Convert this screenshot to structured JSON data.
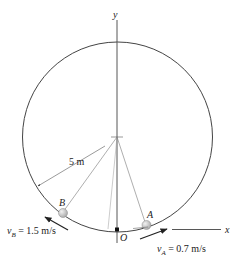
{
  "diagram": {
    "axes": {
      "y_label": "y",
      "x_label": "x"
    },
    "origin_label": "O",
    "radius_label": "5 m",
    "points": [
      {
        "name": "A",
        "velocity_label": "v",
        "velocity_sub": "A",
        "velocity_value": "= 0.7 m/s"
      },
      {
        "name": "B",
        "velocity_label": "v",
        "velocity_sub": "B",
        "velocity_value": "= 1.5 m/s"
      }
    ],
    "colors": {
      "line": "#333333",
      "ball": "#c8c8c8"
    }
  }
}
